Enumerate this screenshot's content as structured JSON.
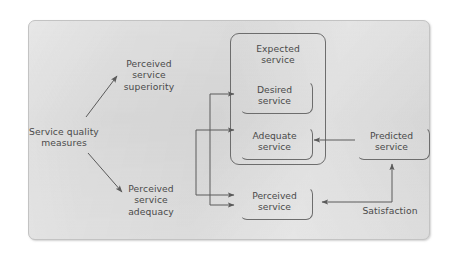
{
  "diagram": {
    "background_color": "#dcdcdc",
    "line_color": "#6d6d6d",
    "text_color": "#4a4a4a",
    "nodes": {
      "service_quality_measures": "Service quality\nmeasures",
      "perceived_service_superiority": "Perceived\nservice\nsuperiority",
      "perceived_service_adequacy": "Perceived\nservice\nadequacy",
      "expected_service": "Expected\nservice",
      "desired_service": "Desired\nservice",
      "adequate_service": "Adequate\nservice",
      "predicted_service": "Predicted\nservice",
      "perceived_service": "Perceived\nservice",
      "satisfaction": "Satisfaction"
    }
  }
}
